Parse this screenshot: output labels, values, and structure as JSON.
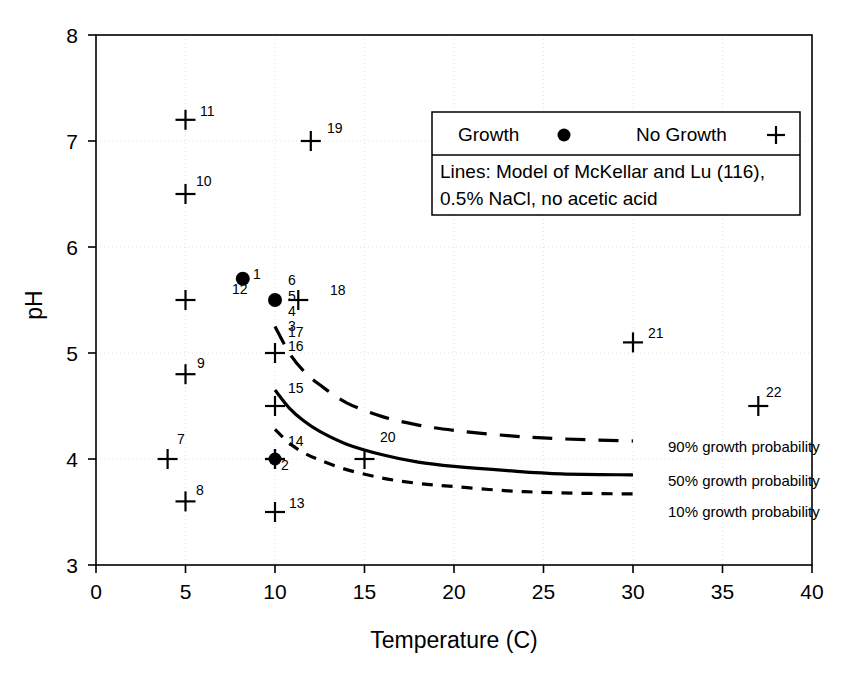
{
  "chart_data": {
    "type": "scatter",
    "title": "",
    "xlabel": "Temperature (C)",
    "ylabel": "pH",
    "xlim": [
      0,
      40
    ],
    "ylim": [
      3,
      8
    ],
    "xticks": [
      0,
      5,
      10,
      15,
      20,
      25,
      30,
      35,
      40
    ],
    "yticks": [
      3,
      4,
      5,
      6,
      7,
      8
    ],
    "grid": true,
    "grid_style": "light dotted",
    "legend_position": "top-right inside plot",
    "series": [
      {
        "name": "Growth",
        "marker": "filled-circle",
        "points": [
          {
            "label": "1",
            "x": 8.2,
            "y": 5.7
          },
          {
            "label": "5",
            "x": 10.0,
            "y": 5.5
          }
        ]
      },
      {
        "name": "No Growth",
        "marker": "plus",
        "points": [
          {
            "label": "12",
            "x": 5.0,
            "y": 5.5
          },
          {
            "label": "18",
            "x": 11.3,
            "y": 5.5
          },
          {
            "label": "16",
            "x": 10.0,
            "y": 5.0
          },
          {
            "label": "9",
            "x": 5.0,
            "y": 4.8
          },
          {
            "label": "15",
            "x": 10.0,
            "y": 4.5
          },
          {
            "label": "11",
            "x": 5.0,
            "y": 7.2
          },
          {
            "label": "10",
            "x": 5.0,
            "y": 6.5
          },
          {
            "label": "19",
            "x": 12.0,
            "y": 7.0
          },
          {
            "label": "21",
            "x": 30.0,
            "y": 5.1
          },
          {
            "label": "22",
            "x": 37.0,
            "y": 4.5
          },
          {
            "label": "7",
            "x": 4.0,
            "y": 4.0
          },
          {
            "label": "8",
            "x": 5.0,
            "y": 3.6
          },
          {
            "label": "20",
            "x": 15.0,
            "y": 4.0
          },
          {
            "label": "13",
            "x": 10.0,
            "y": 3.5
          },
          {
            "label": "2",
            "x": 10.0,
            "y": 4.0
          }
        ]
      },
      {
        "name": "Overlapping Growth and No Growth",
        "marker": "circle-plus-overlap",
        "points": [
          {
            "label": "14",
            "x": 10.0,
            "y": 4.0
          }
        ]
      }
    ],
    "extra_labels": [
      {
        "text": "6",
        "x": 10.0,
        "y": 5.78
      },
      {
        "text": "4",
        "x": 10.0,
        "y": 5.37
      },
      {
        "text": "3",
        "x": 10.0,
        "y": 5.22
      },
      {
        "text": "17",
        "x": 10.0,
        "y": 5.12
      }
    ],
    "curves": [
      {
        "name": "90% growth probability",
        "style": "long-dash",
        "points": [
          [
            10.0,
            5.25
          ],
          [
            10.8,
            5.0
          ],
          [
            11.6,
            4.83
          ],
          [
            12.5,
            4.7
          ],
          [
            14.0,
            4.53
          ],
          [
            16.0,
            4.4
          ],
          [
            18.0,
            4.32
          ],
          [
            20.0,
            4.27
          ],
          [
            23.0,
            4.22
          ],
          [
            26.0,
            4.19
          ],
          [
            30.0,
            4.17
          ]
        ]
      },
      {
        "name": "50% growth probability",
        "style": "solid",
        "points": [
          [
            10.0,
            4.65
          ],
          [
            10.8,
            4.48
          ],
          [
            11.6,
            4.36
          ],
          [
            12.5,
            4.26
          ],
          [
            14.0,
            4.14
          ],
          [
            16.0,
            4.04
          ],
          [
            18.0,
            3.97
          ],
          [
            20.0,
            3.93
          ],
          [
            23.0,
            3.89
          ],
          [
            26.0,
            3.86
          ],
          [
            30.0,
            3.85
          ]
        ]
      },
      {
        "name": "10% growth probability",
        "style": "short-dash",
        "points": [
          [
            10.0,
            4.28
          ],
          [
            10.8,
            4.15
          ],
          [
            11.6,
            4.06
          ],
          [
            12.5,
            3.99
          ],
          [
            14.0,
            3.9
          ],
          [
            16.0,
            3.82
          ],
          [
            18.0,
            3.77
          ],
          [
            20.0,
            3.74
          ],
          [
            23.0,
            3.7
          ],
          [
            26.0,
            3.68
          ],
          [
            30.0,
            3.67
          ]
        ]
      }
    ]
  },
  "axes": {
    "x_title": "Temperature (C)",
    "y_title": "pH",
    "x_tick_labels": [
      "0",
      "5",
      "10",
      "15",
      "20",
      "25",
      "30",
      "35",
      "40"
    ],
    "y_tick_labels": [
      "3",
      "4",
      "5",
      "6",
      "7",
      "8"
    ]
  },
  "legend": {
    "growth_label": "Growth",
    "growth_marker": "filled-circle-marker",
    "no_growth_label": "No Growth",
    "no_growth_marker": "plus-marker",
    "note_line1": "Lines: Model of McKellar and Lu  (116),",
    "note_line2": "0.5% NaCl, no acetic acid"
  },
  "curve_labels": {
    "p90": "90% growth probability",
    "p50": "50% growth probability",
    "p10": "10% growth probability"
  },
  "point_labels": {
    "n1": "1",
    "n2": "2",
    "n3": "3",
    "n4": "4",
    "n5": "5",
    "n6": "6",
    "n7": "7",
    "n8": "8",
    "n9": "9",
    "n10": "10",
    "n11": "11",
    "n12": "12",
    "n13": "13",
    "n14": "14",
    "n15": "15",
    "n16": "16",
    "n17": "17",
    "n18": "18",
    "n19": "19",
    "n20": "20",
    "n21": "21",
    "n22": "22"
  },
  "colors": {
    "foreground": "#000000",
    "background": "#ffffff",
    "grid": "#d8d8d8"
  }
}
